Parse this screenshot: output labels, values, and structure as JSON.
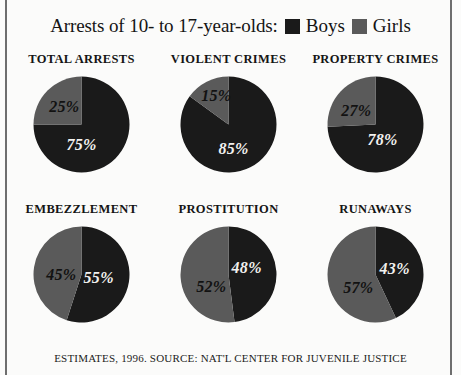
{
  "header": {
    "title": "Arrests of 10- to 17-year-olds:",
    "legend": [
      {
        "label": "Boys",
        "color": "#1a1a1a",
        "swatch": "boys-swatch"
      },
      {
        "label": "Girls",
        "color": "#5a5a5a",
        "swatch": "girls-swatch"
      }
    ]
  },
  "footer": {
    "source": "ESTIMATES, 1996. SOURCE: NAT'L CENTER FOR JUVENILE JUSTICE"
  },
  "colors": {
    "boys": "#1a1a1a",
    "girls": "#5a5a5a",
    "background": "#fbfbfa",
    "rule": "#6e6e6e"
  },
  "chart_data": {
    "type": "pie",
    "title": "Arrests of 10- to 17-year-olds:",
    "legend_entries": [
      "Boys",
      "Girls"
    ],
    "legend_position": "top-inline",
    "series_colors": {
      "Boys": "#1a1a1a",
      "Girls": "#5a5a5a"
    },
    "units": "percent",
    "note": "Property Crimes labels sum to 105% as printed in the source graphic.",
    "charts": [
      {
        "title": "TOTAL ARRESTS",
        "categories": [
          "Boys",
          "Girls"
        ],
        "values": [
          75,
          25
        ],
        "labels": [
          "75%",
          "25%"
        ],
        "label_positions": [
          {
            "text": "75%",
            "x": 50,
            "y": 70,
            "on": "dark"
          },
          {
            "text": "25%",
            "x": 33,
            "y": 33,
            "on": "light"
          }
        ]
      },
      {
        "title": "VIOLENT CRIMES",
        "categories": [
          "Boys",
          "Girls"
        ],
        "values": [
          85,
          15
        ],
        "labels": [
          "85%",
          "15%"
        ],
        "label_positions": [
          {
            "text": "85%",
            "x": 55,
            "y": 74,
            "on": "dark"
          },
          {
            "text": "15%",
            "x": 38,
            "y": 22,
            "on": "light"
          }
        ]
      },
      {
        "title": "PROPERTY CRIMES",
        "categories": [
          "Boys",
          "Girls"
        ],
        "values": [
          78,
          27
        ],
        "labels": [
          "78%",
          "27%"
        ],
        "label_positions": [
          {
            "text": "78%",
            "x": 57,
            "y": 65,
            "on": "dark"
          },
          {
            "text": "27%",
            "x": 31,
            "y": 37,
            "on": "light"
          }
        ]
      },
      {
        "title": "EMBEZZLEMENT",
        "categories": [
          "Boys",
          "Girls"
        ],
        "values": [
          55,
          45
        ],
        "labels": [
          "55%",
          "45%"
        ],
        "label_positions": [
          {
            "text": "55%",
            "x": 67,
            "y": 53,
            "on": "dark"
          },
          {
            "text": "45%",
            "x": 30,
            "y": 50,
            "on": "light"
          }
        ]
      },
      {
        "title": "PROSTITUTION",
        "categories": [
          "Boys",
          "Girls"
        ],
        "values": [
          48,
          52
        ],
        "labels": [
          "48%",
          "52%"
        ],
        "label_positions": [
          {
            "text": "48%",
            "x": 68,
            "y": 44,
            "on": "dark"
          },
          {
            "text": "52%",
            "x": 33,
            "y": 62,
            "on": "light"
          }
        ]
      },
      {
        "title": "RUNAWAYS",
        "categories": [
          "Boys",
          "Girls"
        ],
        "values": [
          43,
          57
        ],
        "labels": [
          "43%",
          "57%"
        ],
        "label_positions": [
          {
            "text": "43%",
            "x": 69,
            "y": 45,
            "on": "dark"
          },
          {
            "text": "57%",
            "x": 33,
            "y": 63,
            "on": "light"
          }
        ]
      }
    ]
  }
}
